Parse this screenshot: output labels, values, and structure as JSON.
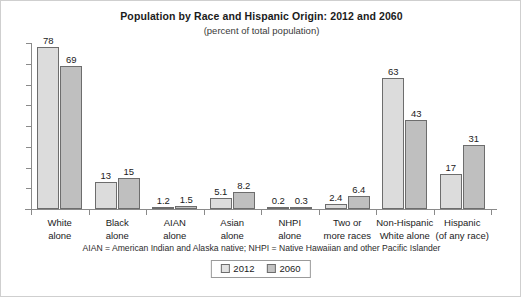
{
  "chart_data": {
    "type": "bar",
    "title": "Population by Race and Hispanic Origin: 2012 and 2060",
    "subtitle": "(percent of total population)",
    "xlabel": "",
    "ylabel": "",
    "ylim": [
      0,
      80
    ],
    "grid": false,
    "legend_position": "bottom",
    "categories": [
      "White\nalone",
      "Black\nalone",
      "AIAN\nalone",
      "Asian\nalone",
      "NHPI\nalone",
      "Two or\nmore races",
      "Non-Hispanic\nWhite alone",
      "Hispanic\n(of any race)"
    ],
    "category_lines": [
      [
        "White",
        "alone"
      ],
      [
        "Black",
        "alone"
      ],
      [
        "AIAN",
        "alone"
      ],
      [
        "Asian",
        "alone"
      ],
      [
        "NHPI",
        "alone"
      ],
      [
        "Two or",
        "more races"
      ],
      [
        "Non-Hispanic",
        "White alone"
      ],
      [
        "Hispanic",
        "(of any race)"
      ]
    ],
    "series": [
      {
        "name": "2012",
        "color": "#dcdcdc",
        "values": [
          78,
          13,
          1.2,
          5.1,
          0.2,
          2.4,
          63,
          17
        ],
        "labels": [
          "78",
          "13",
          "1.2",
          "5.1",
          "0.2",
          "2.4",
          "63",
          "17"
        ]
      },
      {
        "name": "2060",
        "color": "#bfbfbf",
        "values": [
          69,
          15,
          1.5,
          8.2,
          0.3,
          6.4,
          43,
          31
        ],
        "labels": [
          "69",
          "15",
          "1.5",
          "8.2",
          "0.3",
          "6.4",
          "43",
          "31"
        ]
      }
    ],
    "footnote": "AIAN = American Indian and Alaska native; NHPI = Native Hawaiian and other Pacific Islander"
  },
  "legend": {
    "items": [
      {
        "label": "2012"
      },
      {
        "label": "2060"
      }
    ]
  }
}
